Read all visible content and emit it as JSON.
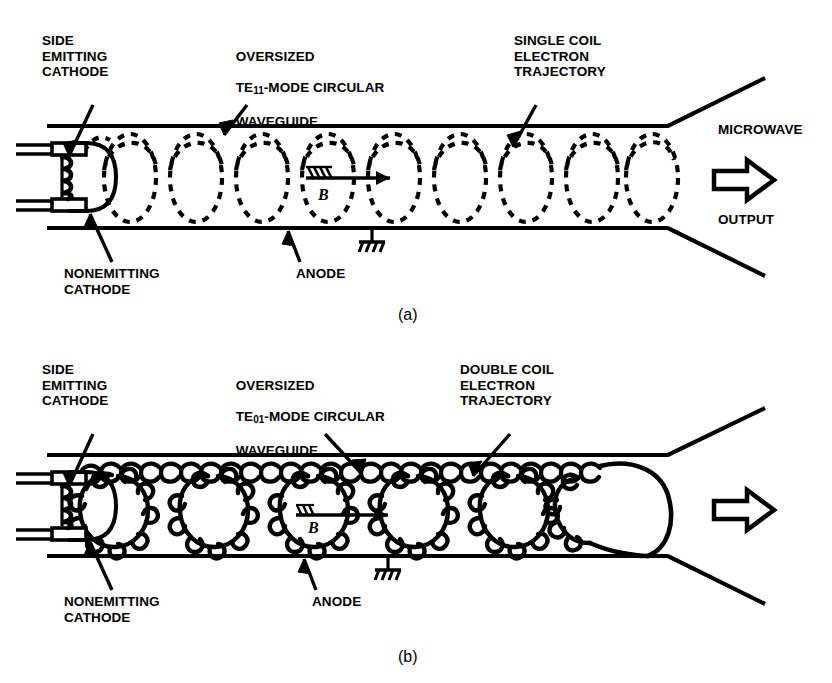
{
  "figure": {
    "type": "technical-diagram",
    "background_color": "#ffffff",
    "ink_color": "#000000"
  },
  "panel_a": {
    "caption": "(a)",
    "labels": {
      "cathode": "SIDE\nEMITTING\nCATHODE",
      "waveguide_line1": "OVERSIZED",
      "waveguide_mode_prefix": "TE",
      "waveguide_mode_sub": "11",
      "waveguide_mode_suffix": "-MODE CIRCULAR",
      "waveguide_line3": "WAVEGUIDE",
      "trajectory": "SINGLE COIL\nELECTRON\nTRAJECTORY",
      "nonemitting": "NONEMITTING\nCATHODE",
      "anode": "ANODE",
      "microwave": "MICROWAVE",
      "output": "OUTPUT",
      "b_field": "B"
    },
    "trajectory_type": "single-coil dashed helix",
    "helix_loops": 9,
    "line_style": "dashed"
  },
  "panel_b": {
    "caption": "(b)",
    "labels": {
      "cathode": "SIDE\nEMITTING\nCATHODE",
      "waveguide_line1": "OVERSIZED",
      "waveguide_mode_prefix": "TE",
      "waveguide_mode_sub": "01",
      "waveguide_mode_suffix": "-MODE CIRCULAR",
      "waveguide_line3": "WAVEGUIDE",
      "trajectory": "DOUBLE COIL\nELECTRON\nTRAJECTORY",
      "nonemitting": "NONEMITTING\nCATHODE",
      "anode": "ANODE",
      "b_field": "B"
    },
    "trajectory_type": "double-coil epicyclic (trochoidal) solid path",
    "large_loops": 6,
    "line_style": "solid"
  },
  "icons": {
    "output_arrow": "hollow-right-arrow",
    "ground": "ground-symbol",
    "b_arrow": "fletched-right-arrow",
    "leader": "leader-line-with-arrowhead"
  }
}
